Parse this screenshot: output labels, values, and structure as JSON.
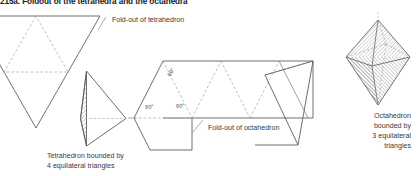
{
  "figure": {
    "title": "215a. Foldout of the tetrahedra and the octahedra",
    "background_color": "#ffffff",
    "solid_line_color": "#555555",
    "dashed_line_color": "#9a9a9a",
    "hatch_color": "#8c8c8c",
    "text_color": "#3a3a3a"
  },
  "labels": {
    "foldout_tetrahedron": "Fold-out of tetrahedron",
    "foldout_octahedron": "Fold-out of octahedron",
    "tetrahedron_caption_line1": "Tetrahedron bounded by",
    "tetrahedron_caption_line2": "4 equilateral triangles",
    "octahedron_caption_line1": "Octahedron",
    "octahedron_caption_line2": "bounded by",
    "octahedron_caption_line3": "3 equilateral",
    "octahedron_caption_line4": "triangles"
  },
  "angles": {
    "apex": "60°",
    "left": "60°",
    "right": "60°"
  },
  "diagram_data": {
    "type": "geometric-net-diagram",
    "elements": [
      {
        "name": "tetrahedron-net",
        "description": "Large downward-pointing triangle subdivided into 4 equilateral triangles by dashed midlines",
        "face_count": 4,
        "clipped_at_left_edge": true
      },
      {
        "name": "tetrahedron-solid",
        "description": "Tetrahedron drawn in perspective with hatched left face and dashed hidden edges",
        "face_count": 4
      },
      {
        "name": "octahedron-net",
        "description": "Strip of 8 equilateral triangles alternating up and down, angles of 60 degrees marked on the first triangle",
        "face_count": 8
      },
      {
        "name": "octahedron-solid",
        "description": "Octahedron drawn in perspective with hatched faces and dashed hidden edges",
        "face_count": 8
      }
    ]
  }
}
